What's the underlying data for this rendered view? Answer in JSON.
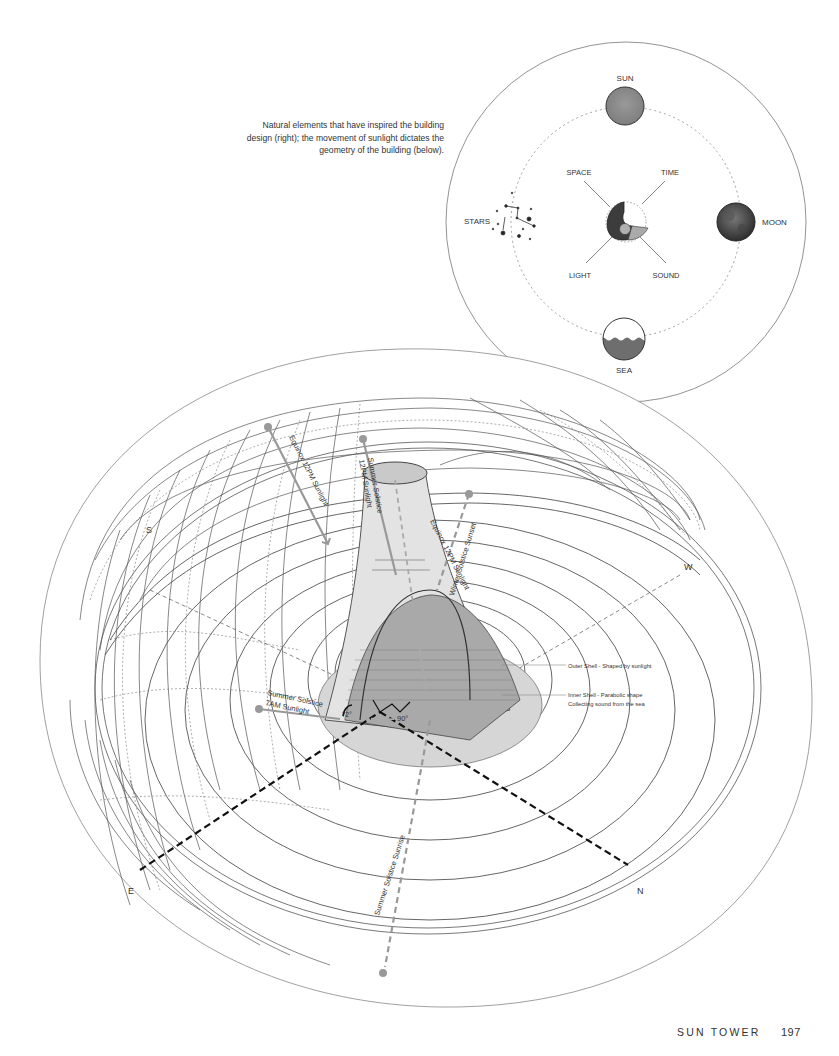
{
  "caption": "Natural elements that have inspired the building design (right); the movement of sunlight dictates the geometry of the building (below).",
  "elements_diagram": {
    "outer": {
      "sun": "SUN",
      "moon": "MOON",
      "sea": "SEA",
      "stars": "STARS"
    },
    "inner": {
      "space": "SPACE",
      "time": "TIME",
      "light": "LIGHT",
      "sound": "SOUND"
    }
  },
  "sun_path_diagram": {
    "compass": {
      "south": "S",
      "west": "W",
      "east": "E",
      "north": "N"
    },
    "sunlight_labels": {
      "equinox_12pm_upper": "Equinox 12PM Sunlight",
      "summer_solstice_12pm_line1": "Summer Solstice",
      "summer_solstice_12pm_line2": "12PM Sunlight",
      "winter_solstice_sunset": "Winter Solstice Sunset",
      "equinox_12pm_tower": "Equinox 12PM Sunlight",
      "summer_solstice_7am_line1": "Summer Solstice",
      "summer_solstice_7am_line2": "7AM Sunlight",
      "summer_solstice_sunrise": "Summer Solstice Sunrise"
    },
    "angles": {
      "tilt": "72°",
      "right": "90°"
    },
    "annotations": {
      "outer_shell": "Outer Shell - Shaped by sunlight",
      "inner_shell_line1": "Inner Shell - Parabolic shape",
      "inner_shell_line2": "Collecting sound from the sea"
    }
  },
  "footer": {
    "running_head": "SUN TOWER",
    "page_number": "197"
  },
  "colors": {
    "ink": "#333333",
    "sun_gray": "#8a8a8a",
    "arrow_gray": "#9a9a9a",
    "tower_fill": "#c9c9c9",
    "base_fill": "#d6d6d6"
  }
}
